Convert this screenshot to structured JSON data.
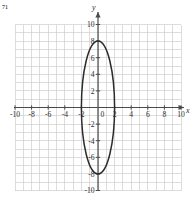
{
  "figure": {
    "corner_mark": "71",
    "background_color": "#ffffff",
    "grid_color": "#cfcfcf",
    "axis_color": "#4a4a4a",
    "curve_color": "#2b2b2b",
    "label_color": "#2b2b2b"
  },
  "axes": {
    "x_axis_name": "x",
    "y_axis_name": "y",
    "x_labels": [
      "-10",
      "-8",
      "-6",
      "-4",
      "-2",
      "0",
      "2",
      "4",
      "6",
      "8",
      "10"
    ],
    "x_label_values": [
      -10,
      -8,
      -6,
      -4,
      -2,
      0,
      2,
      4,
      6,
      8,
      10
    ],
    "y_labels": [
      "10",
      "8",
      "6",
      "4",
      "2",
      "-2",
      "-4",
      "-6",
      "-8",
      "-10"
    ],
    "y_label_values": [
      10,
      8,
      6,
      4,
      2,
      -2,
      -4,
      -6,
      -8,
      -10
    ]
  },
  "chart_data": {
    "type": "line",
    "title": "",
    "xlabel": "x",
    "ylabel": "y",
    "xlim": [
      -11,
      11
    ],
    "ylim": [
      -11,
      11
    ],
    "grid": true,
    "grid_spacing": 1,
    "legend": "none",
    "xticks": [
      -10,
      -8,
      -6,
      -4,
      -2,
      0,
      2,
      4,
      6,
      8,
      10
    ],
    "yticks": [
      -10,
      -8,
      -6,
      -4,
      -2,
      2,
      4,
      6,
      8,
      10
    ],
    "series": [
      {
        "name": "ellipse",
        "shape": "ellipse",
        "center": [
          0,
          0
        ],
        "semi_axis_x": 2,
        "semi_axis_y": 8,
        "orientation": "vertical",
        "vertices": [
          [
            0,
            8
          ],
          [
            0,
            -8
          ]
        ],
        "co_vertices": [
          [
            -2,
            0
          ],
          [
            2,
            0
          ]
        ],
        "equation": "x^2/4 + y^2/64 = 1"
      }
    ]
  }
}
